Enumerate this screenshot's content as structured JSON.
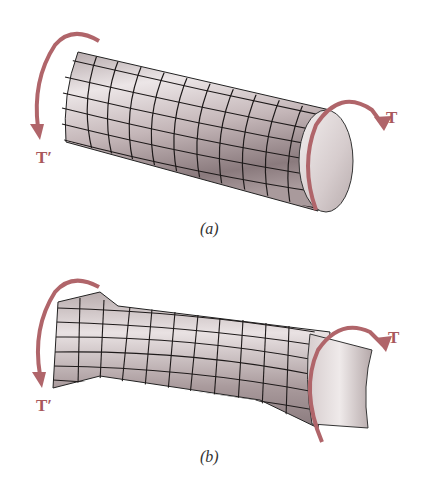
{
  "figure_a": {
    "caption": "(a)",
    "subject": "circular shaft under torsion",
    "torque_right_label": "T",
    "torque_left_label": "T′"
  },
  "figure_b": {
    "caption": "(b)",
    "subject": "rectangular bar under torsion (warped)",
    "torque_right_label": "T",
    "torque_left_label": "T′"
  },
  "colors": {
    "arrow": "#b0656a",
    "label": "#a8585c",
    "surface_light": "#ece6e7",
    "surface_dark": "#8a7a7d",
    "grid_line": "#1e1a1a",
    "background": "#ffffff"
  }
}
